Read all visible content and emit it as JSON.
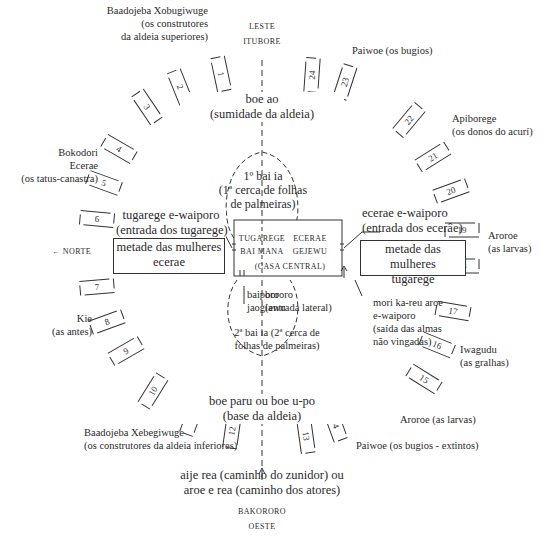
{
  "compass": {
    "east": [
      "LESTE",
      "ITUBORE"
    ],
    "west": [
      "BAKORORO",
      "OESTE"
    ],
    "north": "← NORTE"
  },
  "axis_labels": {
    "top_title": "boe ao",
    "top_sub": "(sumidade da aldeia)",
    "bottom_title": "boe paru ou boe u-po",
    "bottom_sub": "(base da aldeia)",
    "path_line1": "aije rea (caminho do zunidor) ou",
    "path_line2": "aroe e rea (caminho dos atores)"
  },
  "clans": [
    {
      "name": "Baadojeba Xobugiwuge",
      "lines": [
        "(os construtores",
        "da aldeia superiores)"
      ]
    },
    {
      "name": "Paiwoe (os bugios)",
      "lines": []
    },
    {
      "name": "Apiborege",
      "lines": [
        "(os donos do acurí)"
      ]
    },
    {
      "name": "Bokodori",
      "lines": [
        "Ecerae",
        "(os tatus-canastra)"
      ]
    },
    {
      "name": "Aroroe",
      "lines": [
        "(as larvas)"
      ]
    },
    {
      "name": "Kie",
      "lines": [
        "(as antes)"
      ]
    },
    {
      "name": "Iwagudu",
      "lines": [
        "(as gralhas)"
      ]
    },
    {
      "name": "Aroroe (as larvas)",
      "lines": []
    },
    {
      "name": "Baadojeba Xebegiwuge",
      "lines": [
        "(os construtores da aldeia inferiores)"
      ]
    },
    {
      "name": "Paiwoe (os bugios - extintos)",
      "lines": []
    }
  ],
  "entrances": {
    "tugarege": [
      "tugarege e-waiporo",
      "(entrada dos tugarege)"
    ],
    "ecerae": [
      "ecerae e-waiporo",
      "(entrada dos ecerâe)"
    ],
    "mori": [
      "mori ka-reu aroe",
      "e-waiporo",
      "(saída das almas",
      "não vingadas)"
    ]
  },
  "halves": {
    "left": [
      "metade das mulheres",
      "ecerae"
    ],
    "right": [
      "metade das mulheres",
      "tugarege"
    ]
  },
  "center": {
    "fence1": [
      "1º bai ia",
      "(1ª cerca de folhas",
      "de palmeiras)"
    ],
    "house_left": [
      "TUGAREGE",
      "BAI MANA"
    ],
    "house_right": [
      "ECERAE",
      "GEJEWU"
    ],
    "house_name": "(CASA CENTRAL)",
    "baiporo": [
      "baiporo",
      "jaogiawu"
    ],
    "bororo": [
      "bororo",
      "(entrada lateral)"
    ],
    "fence2": [
      "2ª bai ia (2ª cerca de",
      "folhas de palmeiras)"
    ]
  },
  "houses": [
    "1",
    "2",
    "3",
    "4",
    "5",
    "6",
    "7",
    "8",
    "9",
    "10",
    "11",
    "12",
    "13",
    "14",
    "15",
    "16",
    "17",
    "18",
    "19",
    "20",
    "21",
    "22",
    "23",
    "24"
  ]
}
